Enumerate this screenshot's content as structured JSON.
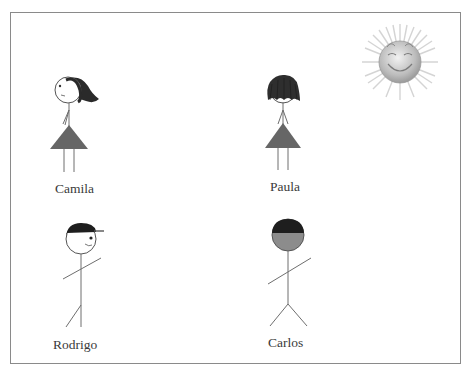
{
  "scene": {
    "type": "illustration",
    "description": "Four stick figures with names and a smiling sun",
    "colors": {
      "frame": "#8a8a8a",
      "line": "#6e6e6e",
      "dress": "#666666",
      "hair": "#2a2a2a",
      "cap": "#1e1e1e",
      "carlos_face": "#8c8c8c",
      "sun": "#bdbdbd"
    }
  },
  "figures": [
    {
      "name": "Camila",
      "label": "Camila",
      "kind": "girl",
      "hair": "long-windblown"
    },
    {
      "name": "Paula",
      "label": "Paula",
      "kind": "girl",
      "hair": "short-messy"
    },
    {
      "name": "Rodrigo",
      "label": "Rodrigo",
      "kind": "boy",
      "headwear": "cap"
    },
    {
      "name": "Carlos",
      "label": "Carlos",
      "kind": "boy",
      "headwear": "dark-hair-gray-face"
    }
  ],
  "sun": {
    "icon": "smiling-sun-icon",
    "expression": "happy"
  }
}
